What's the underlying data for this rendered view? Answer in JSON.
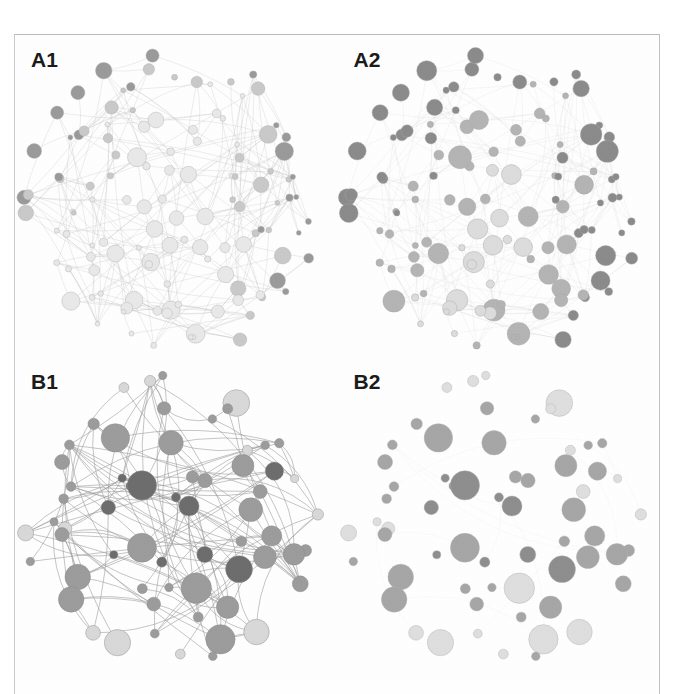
{
  "figure": {
    "kind": "network-graph-panel-figure",
    "width": 686,
    "height": 679,
    "background_color": "#ffffff",
    "frame_color": "#bdbdbd",
    "panel_count": 4,
    "panel_layout": "2x2"
  },
  "panels": [
    {
      "id": "A1",
      "label": "A1",
      "position": "top-left",
      "description": "Dense network, many small light-gray nodes with fine gray edges; darker nodes along the right rim.",
      "layout": "circular-disc",
      "node_count": 120,
      "edge_count": 300,
      "node_fill_light": "#e8e8e8",
      "node_fill_mid": "#c9c9c9",
      "node_fill_dark": "#9a9a9a",
      "node_stroke": "#b0b0b0",
      "edge_color": "#b5b5b5",
      "edge_opacity": 0.55,
      "edge_width": 0.45,
      "min_radius": 2.4,
      "max_radius": 9.5,
      "center_x": 0.5,
      "center_y": 0.53,
      "disc_radius": 0.455,
      "seed": 1021,
      "dark_side": "right",
      "dark_fraction": 0.22,
      "edges_visible": true
    },
    {
      "id": "A2",
      "label": "A2",
      "position": "top-right",
      "description": "Same dense network topology but nodes are larger and darker; dark nodes cluster top-left and right rim, edges are faint.",
      "layout": "circular-disc",
      "node_count": 120,
      "edge_count": 300,
      "node_fill_light": "#dcdcdc",
      "node_fill_mid": "#b4b4b4",
      "node_fill_dark": "#8b8b8b",
      "node_stroke": "#a8a8a8",
      "edge_color": "#c6c6c6",
      "edge_opacity": 0.4,
      "edge_width": 0.4,
      "min_radius": 3.0,
      "max_radius": 11.5,
      "center_x": 0.5,
      "center_y": 0.53,
      "disc_radius": 0.455,
      "seed": 1021,
      "dark_side": "right",
      "dark_fraction": 0.42,
      "edges_visible": true
    },
    {
      "id": "B1",
      "label": "B1",
      "position": "bottom-left",
      "description": "Sparser network, about 60 nodes, strong long curved edges criss-crossing the disc; mix of dark-gray and light-gray nodes.",
      "layout": "circular-disc",
      "node_count": 62,
      "edge_count": 150,
      "node_fill_light": "#d8d8d8",
      "node_fill_mid": "#9c9c9c",
      "node_fill_dark": "#6d6d6d",
      "node_stroke": "#8a8a8a",
      "edge_color": "#9e9e9e",
      "edge_opacity": 0.75,
      "edge_width": 0.8,
      "min_radius": 4.0,
      "max_radius": 16.0,
      "center_x": 0.5,
      "center_y": 0.5,
      "disc_radius": 0.46,
      "seed": 7731,
      "dark_side": "center",
      "dark_fraction": 0.55,
      "edges_visible": true
    },
    {
      "id": "B2",
      "label": "B2",
      "position": "bottom-right",
      "description": "Same sparse node set as B1 but essentially no edges drawn; nodes only, medium-gray to light-gray.",
      "layout": "circular-disc",
      "node_count": 62,
      "edge_count": 18,
      "node_fill_light": "#dedede",
      "node_fill_mid": "#a6a6a6",
      "node_fill_dark": "#8e8e8e",
      "node_stroke": "#b4b4b4",
      "edge_color": "#dadada",
      "edge_opacity": 0.35,
      "edge_width": 0.4,
      "min_radius": 4.0,
      "max_radius": 16.0,
      "center_x": 0.5,
      "center_y": 0.5,
      "disc_radius": 0.46,
      "seed": 7731,
      "dark_side": "center",
      "dark_fraction": 0.5,
      "edges_visible": false
    }
  ],
  "chart_data": {
    "type": "scatter",
    "title": "",
    "xlabel": "",
    "ylabel": "",
    "series": [
      {
        "name": "A1",
        "n_nodes": 120,
        "n_edges": 300,
        "node_size_range": [
          2.4,
          9.5
        ],
        "node_gray_levels": [
          "#e8e8e8",
          "#c9c9c9",
          "#9a9a9a"
        ]
      },
      {
        "name": "A2",
        "n_nodes": 120,
        "n_edges": 300,
        "node_size_range": [
          3.0,
          11.5
        ],
        "node_gray_levels": [
          "#dcdcdc",
          "#b4b4b4",
          "#8b8b8b"
        ]
      },
      {
        "name": "B1",
        "n_nodes": 62,
        "n_edges": 150,
        "node_size_range": [
          4.0,
          16.0
        ],
        "node_gray_levels": [
          "#d8d8d8",
          "#9c9c9c",
          "#6d6d6d"
        ]
      },
      {
        "name": "B2",
        "n_nodes": 62,
        "n_edges": 18,
        "node_size_range": [
          4.0,
          16.0
        ],
        "node_gray_levels": [
          "#dedede",
          "#a6a6a6",
          "#8e8e8e"
        ]
      }
    ],
    "legend_position": "none",
    "grid": false
  }
}
